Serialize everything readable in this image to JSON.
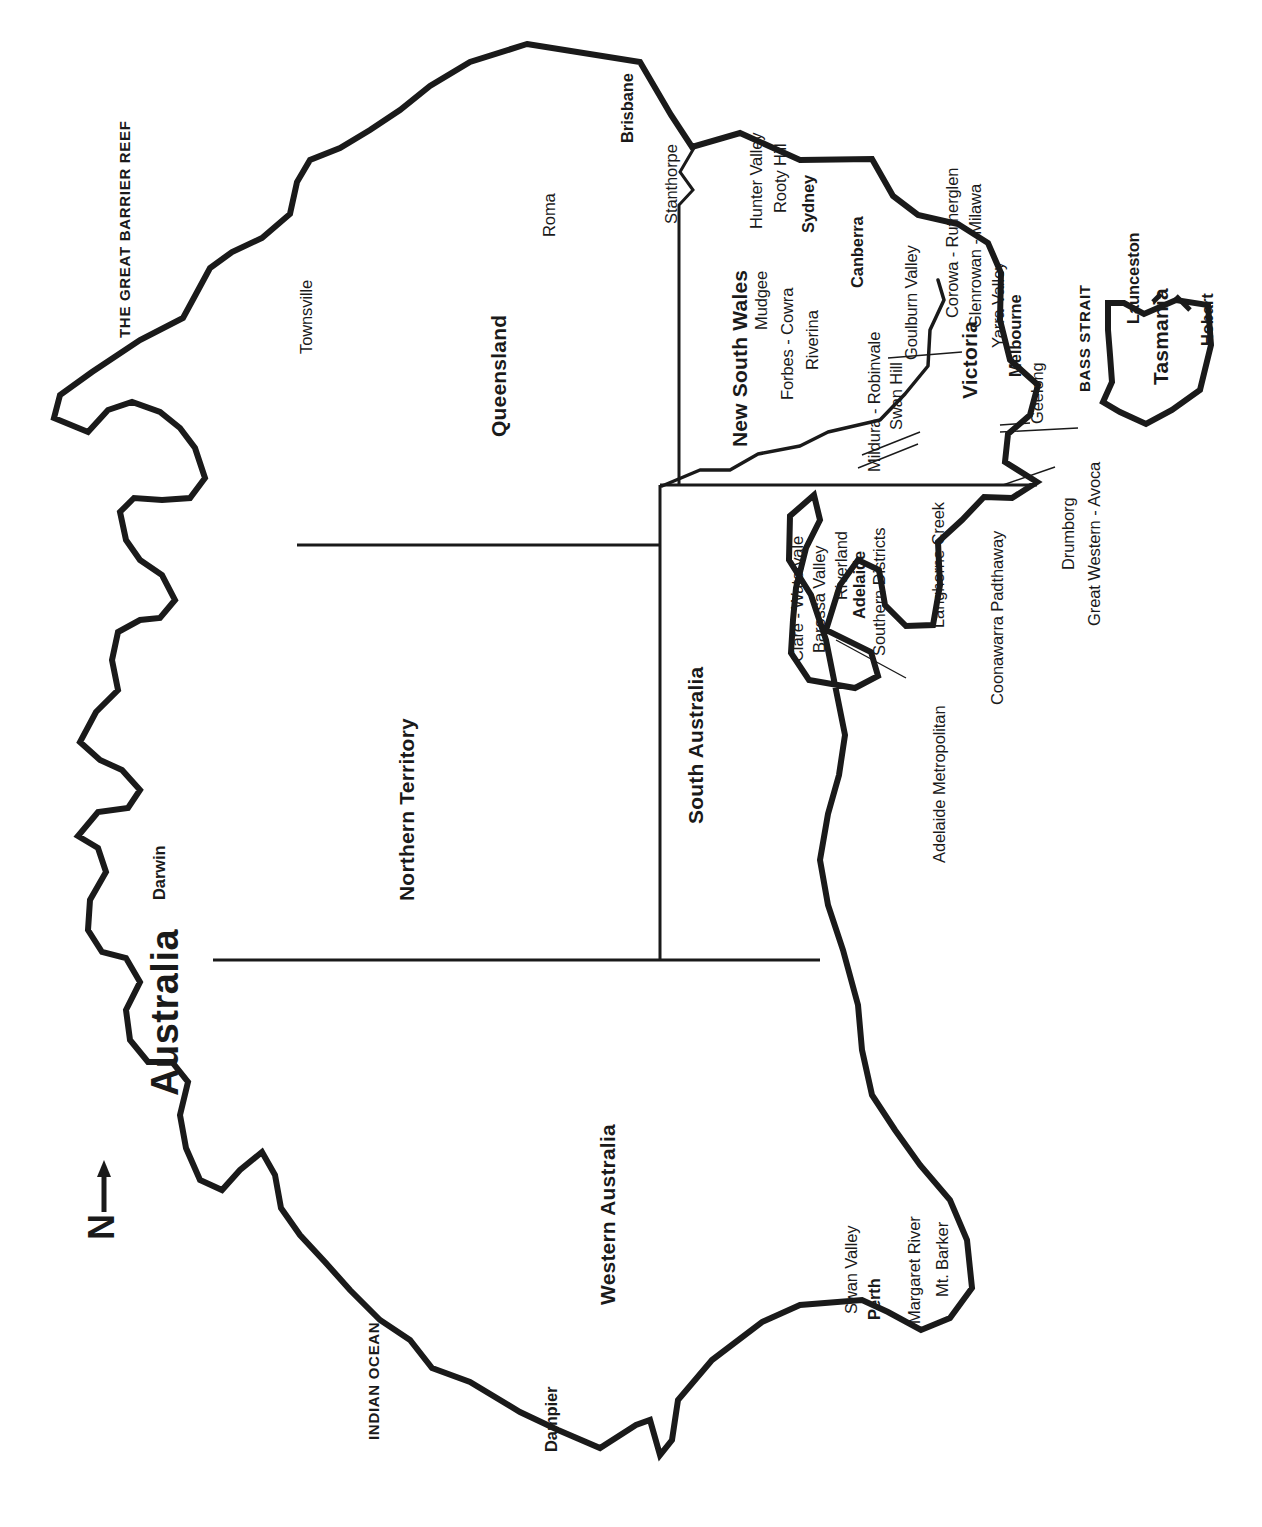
{
  "map": {
    "title": "Australia",
    "compass": {
      "label": "N",
      "icon": "north-arrow-icon"
    },
    "orientation_note": "map and all labels rotated 90 degrees",
    "colors": {
      "coastline": "#1a1a1a",
      "border": "#1a1a1a",
      "land": "#ffffff",
      "background": "#ffffff",
      "text": "#1a1a1a"
    }
  },
  "water_labels": [
    {
      "name": "THE GREAT BARRIER REEF"
    },
    {
      "name": "INDIAN OCEAN"
    },
    {
      "name": "BASS STRAIT"
    }
  ],
  "states": [
    {
      "name": "Queensland"
    },
    {
      "name": "New South Wales"
    },
    {
      "name": "Northern Territory"
    },
    {
      "name": "South Australia"
    },
    {
      "name": "Western Australia"
    },
    {
      "name": "Victoria"
    },
    {
      "name": "Tasmania"
    }
  ],
  "capitals": [
    {
      "name": "Brisbane"
    },
    {
      "name": "Sydney"
    },
    {
      "name": "Canberra"
    },
    {
      "name": "Adelaide"
    },
    {
      "name": "Melbourne"
    },
    {
      "name": "Perth"
    },
    {
      "name": "Hobart"
    },
    {
      "name": "Darwin"
    }
  ],
  "cities": [
    {
      "name": "Townsville"
    },
    {
      "name": "Dampier"
    },
    {
      "name": "Launceston"
    },
    {
      "name": "Geelong"
    }
  ],
  "regions": {
    "queensland": [
      {
        "name": "Roma"
      },
      {
        "name": "Stanthorpe"
      }
    ],
    "new_south_wales": [
      {
        "name": "Hunter Valley"
      },
      {
        "name": "Rooty Hill"
      },
      {
        "name": "Mudgee"
      },
      {
        "name": "Forbes - Cowra"
      },
      {
        "name": "Riverina"
      }
    ],
    "victoria": [
      {
        "name": "Mildura - Robinvale"
      },
      {
        "name": "Swan Hill"
      },
      {
        "name": "Goulburn Valley"
      },
      {
        "name": "Corowa - Rutherglen"
      },
      {
        "name": "Glenrowan - Milawa"
      },
      {
        "name": "Yarra Valley"
      },
      {
        "name": "Drumborg"
      },
      {
        "name": "Great Western - Avoca"
      }
    ],
    "south_australia": [
      {
        "name": "Clare - Watervale"
      },
      {
        "name": "Barossa Valley"
      },
      {
        "name": "Riverland"
      },
      {
        "name": "Southern Districts"
      },
      {
        "name": "Langhorne Creek"
      },
      {
        "name": "Coonawarra Padthaway"
      },
      {
        "name": "Adelaide Metropolitan"
      }
    ],
    "western_australia": [
      {
        "name": "Swan Valley"
      },
      {
        "name": "Margaret River"
      },
      {
        "name": "Mt. Barker"
      }
    ]
  },
  "labels": {
    "title": "Australia",
    "compass_n": "N",
    "great_barrier_reef": "THE GREAT BARRIER REEF",
    "indian_ocean": "INDIAN OCEAN",
    "bass_strait": "BASS STRAIT",
    "queensland": "Queensland",
    "new_south_wales": "New South Wales",
    "northern_territory": "Northern Territory",
    "south_australia": "South Australia",
    "western_australia": "Western Australia",
    "victoria": "Victoria",
    "tasmania": "Tasmania",
    "brisbane": "Brisbane",
    "sydney": "Sydney",
    "canberra": "Canberra",
    "adelaide": "Adelaide",
    "melbourne": "Melbourne",
    "perth": "Perth",
    "hobart": "Hobart",
    "darwin": "Darwin",
    "townsville": "Townsville",
    "dampier": "Dampier",
    "launceston": "Launceston",
    "geelong": "Geelong",
    "roma": "Roma",
    "stanthorpe": "Stanthorpe",
    "hunter_valley": "Hunter Valley",
    "rooty_hill": "Rooty Hill",
    "mudgee": "Mudgee",
    "forbes_cowra": "Forbes - Cowra",
    "riverina": "Riverina",
    "mildura_robinvale": "Mildura - Robinvale",
    "swan_hill": "Swan Hill",
    "goulburn_valley": "Goulburn Valley",
    "corowa_rutherglen": "Corowa - Rutherglen",
    "glenrowan_milawa": "Glenrowan - Milawa",
    "yarra_valley": "Yarra Valley",
    "drumborg": "Drumborg",
    "great_western_avoca": "Great Western - Avoca",
    "clare_watervale": "Clare - Watervale",
    "barossa_valley": "Barossa Valley",
    "riverland": "Riverland",
    "southern_districts": "Southern Districts",
    "langhorne_creek": "Langhorne Creek",
    "coonawarra_padthaway": "Coonawarra Padthaway",
    "adelaide_metropolitan": "Adelaide Metropolitan",
    "swan_valley": "Swan Valley",
    "margaret_river": "Margaret River",
    "mt_barker": "Mt. Barker"
  }
}
